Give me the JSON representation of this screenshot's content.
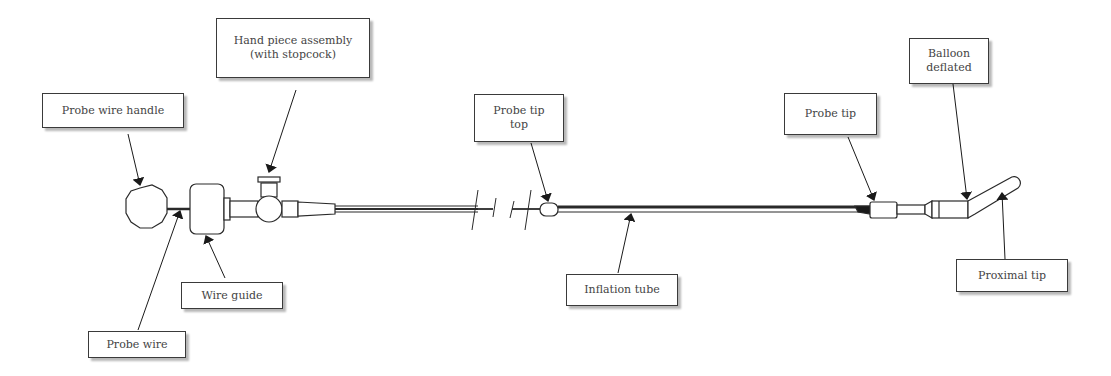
{
  "diagram": {
    "type": "labeled-device-schematic",
    "colors": {
      "line": "#2a2a2a",
      "background": "#ffffff",
      "label_text": "#444444"
    },
    "labels": [
      {
        "id": "hand-piece-assembly",
        "text": "Hand piece assembly\n(with stopcock)"
      },
      {
        "id": "probe-wire-handle",
        "text": "Probe wire handle"
      },
      {
        "id": "wire-guide",
        "text": "Wire guide"
      },
      {
        "id": "probe-wire",
        "text": "Probe wire"
      },
      {
        "id": "probe-tip-top",
        "text": "Probe tip\ntop"
      },
      {
        "id": "inflation-tube",
        "text": "Inflation tube"
      },
      {
        "id": "probe-tip",
        "text": "Probe tip"
      },
      {
        "id": "balloon-deflated",
        "text": "Balloon\ndeflated"
      },
      {
        "id": "proximal-tip",
        "text": "Proximal tip"
      }
    ]
  }
}
